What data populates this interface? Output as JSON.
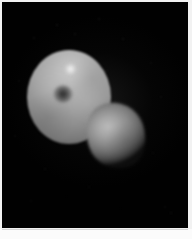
{
  "image": {
    "kind": "astronomical-photograph",
    "subject": "two-body-system",
    "background_label": "black sky background",
    "caption": "",
    "colors": {
      "background": "#010101",
      "frame": "#f2f2f2",
      "margin": "#fbfbfb",
      "primary_body_highlight": "#c9c9c9",
      "primary_body_midtone": "#a2a2a2",
      "primary_body_limb": "#3a3a3a",
      "secondary_body_highlight": "#b6b6b6",
      "secondary_body_midtone": "#888888",
      "dark_spot": "#1c1c1c",
      "bright_spot": "#ffffff"
    }
  },
  "bodies": {
    "primary": {
      "name": "primary-body",
      "shape": "round sphere",
      "description": "large illuminated round body, upper left",
      "features": {
        "dark_spot": {
          "name": "dark-central-spot",
          "description": "dark circular albedo feature near the centre"
        },
        "bright_spot": {
          "name": "bright-highlight-spot",
          "description": "small bright highlight in the upper hemisphere"
        }
      }
    },
    "secondary": {
      "name": "secondary-body",
      "shape": "irregular teardrop",
      "description": "smaller irregular body at lower right, partly overlapping the primary"
    }
  },
  "background_specks": [
    {
      "x": 56,
      "y": 24,
      "size": 2.0,
      "opacity": 0.45
    },
    {
      "x": 98,
      "y": 18,
      "size": 1.6,
      "opacity": 0.32
    },
    {
      "x": 122,
      "y": 38,
      "size": 2.2,
      "opacity": 0.4
    },
    {
      "x": 136,
      "y": 27,
      "size": 1.4,
      "opacity": 0.28
    },
    {
      "x": 33,
      "y": 37,
      "size": 1.5,
      "opacity": 0.3
    },
    {
      "x": 74,
      "y": 33,
      "size": 1.8,
      "opacity": 0.35
    },
    {
      "x": 150,
      "y": 62,
      "size": 1.5,
      "opacity": 0.26
    },
    {
      "x": 160,
      "y": 96,
      "size": 1.7,
      "opacity": 0.24
    },
    {
      "x": 18,
      "y": 80,
      "size": 1.5,
      "opacity": 0.26
    },
    {
      "x": 14,
      "y": 135,
      "size": 1.8,
      "opacity": 0.28
    },
    {
      "x": 44,
      "y": 168,
      "size": 1.6,
      "opacity": 0.24
    },
    {
      "x": 88,
      "y": 186,
      "size": 1.5,
      "opacity": 0.22
    },
    {
      "x": 152,
      "y": 152,
      "size": 1.6,
      "opacity": 0.22
    },
    {
      "x": 164,
      "y": 206,
      "size": 2.4,
      "opacity": 0.3
    },
    {
      "x": 170,
      "y": 212,
      "size": 1.6,
      "opacity": 0.24
    },
    {
      "x": 120,
      "y": 208,
      "size": 1.4,
      "opacity": 0.18
    },
    {
      "x": 30,
      "y": 200,
      "size": 1.5,
      "opacity": 0.18
    },
    {
      "x": 106,
      "y": 70,
      "size": 1.5,
      "opacity": 0.22
    },
    {
      "x": 141,
      "y": 118,
      "size": 1.4,
      "opacity": 0.2
    },
    {
      "x": 66,
      "y": 196,
      "size": 1.4,
      "opacity": 0.18
    }
  ]
}
